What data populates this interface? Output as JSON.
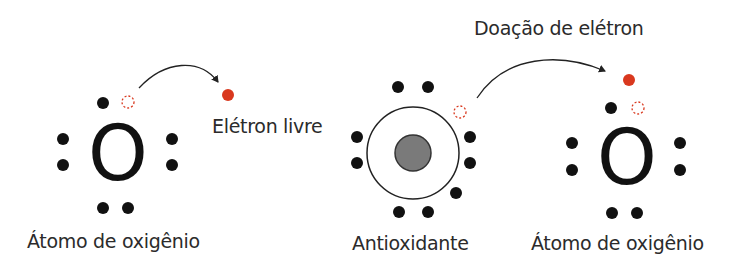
{
  "labels": {
    "left_atom": "Átomo de oxigênio",
    "free_electron": "Elétron livre",
    "antioxidant": "Antioxidante",
    "donation": "Doação de elétron",
    "right_atom": "Átomo de oxigênio"
  },
  "symbols": {
    "left_atom": "O",
    "right_atom": "O"
  },
  "colors": {
    "electron": "#111111",
    "free_electron": "#d9381e",
    "vacancy": "#d9381e",
    "nucleus": "#7a7a7a",
    "shell": "#222222",
    "arrow": "#222222",
    "text": "#2b2b2b"
  }
}
